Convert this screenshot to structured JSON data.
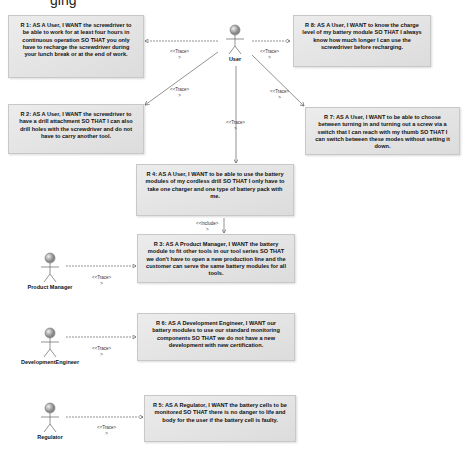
{
  "diagram": {
    "top_partial_text": "ging",
    "actors": [
      {
        "id": "user",
        "label": "User"
      },
      {
        "id": "product-manager",
        "label": "Product Manager"
      },
      {
        "id": "development-engineer",
        "label": "DevelopmentEngineer"
      },
      {
        "id": "regulator",
        "label": "Regulator"
      }
    ],
    "requirements": {
      "r1": "R 1: AS A User, I WANT the screwdriver to be able to work for at least four hours in continuous operation SO THAT  you only have to recharge the screwdriver during your lunch break or at the end of work.",
      "r8": "R 8: AS A User, I WANT to know the charge level of my battery module SO THAT I always know how much longer I can use the screwdriver before recharging.",
      "r2": "R 2: AS A User, I WANT the screwdriver to have a drill attachment SO THAT  I can also drill holes with the screwdriver and do not have to carry another tool.",
      "r7": "R 7: AS A User, I WANT to be able to choose between turning in and turning out a screw via a switch that I can reach with my thumb SO THAT I can switch between these modes without setting it down.",
      "r4": "R 4: AS A User, I WANT to be able to use the battery modules of my cordless drill SO THAT I only have to take one charger and one type of battery pack with me.",
      "r3": "R 3: AS A Product Manager, I WANT the battery module to fit other tools in our tool series SO THAT  we don't have to open a new production line and the customer can serve the same battery modules for all tools.",
      "r6": "R 6: AS A Development Engineer, I WANT our battery modules to use our standard monitoring components SO THAT we do not have a new development with new certification.",
      "r5": "R 5: AS A Regulator, I WANT the battery cells to be monitored SO THAT there is no danger to life and body for the user if the battery cell is faulty."
    },
    "stereotypes": {
      "trace": "<<Trace>",
      "trace_tail": ">",
      "include": "<<Include>",
      "include_tail": ">"
    }
  }
}
